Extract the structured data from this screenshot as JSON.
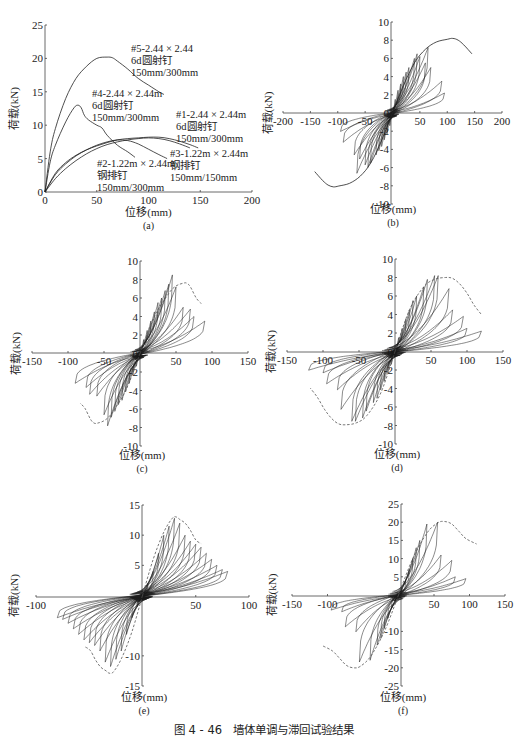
{
  "caption": "图 4 - 46　墙体单调与滞回试验结果",
  "chart_data": [
    {
      "id": "a",
      "type": "line",
      "panel_label": "(a)",
      "xlabel": "位移(mm)",
      "ylabel": "荷载(kN)",
      "xlim": [
        0,
        200
      ],
      "ylim": [
        0,
        25
      ],
      "xticks": [
        0,
        50,
        100,
        150,
        200
      ],
      "yticks": [
        0,
        5,
        10,
        15,
        20,
        25
      ],
      "series": [
        {
          "name": "#5-2.44×2.44 6d圆射钉 150mm/300mm",
          "x": [
            0,
            5,
            10,
            20,
            30,
            40,
            50,
            60,
            65,
            70,
            80,
            90,
            100,
            110,
            115
          ],
          "y": [
            0,
            6,
            9.5,
            14,
            17,
            18.8,
            20,
            20.2,
            20.1,
            19.6,
            18.4,
            17,
            16,
            15,
            14.6
          ]
        },
        {
          "name": "#4-2.44×2.44m 6d圆射钉 150mm/300mm",
          "x": [
            0,
            5,
            10,
            20,
            28,
            32,
            35,
            38,
            42,
            50,
            55,
            60,
            70,
            80,
            87
          ],
          "y": [
            0,
            4.5,
            7,
            10.5,
            12.6,
            13,
            12.6,
            11.5,
            10.8,
            10,
            9.6,
            8.5,
            7,
            6,
            5.2
          ]
        },
        {
          "name": "#1-2.44×2.44m 6d圆射钉 150mm/300mm",
          "x": [
            0,
            10,
            20,
            30,
            40,
            50,
            60,
            70,
            80,
            90,
            100,
            110,
            120,
            130,
            140,
            148
          ],
          "y": [
            0,
            2.8,
            4.4,
            5.5,
            6.3,
            6.9,
            7.4,
            7.8,
            8,
            8.1,
            8.2,
            8.2,
            8,
            7.6,
            7.1,
            6.6
          ]
        },
        {
          "name": "#2-1.22m×2.44m 钢排钉 150mm/300mm",
          "x": [
            0,
            10,
            20,
            30,
            40,
            50,
            60,
            70,
            80,
            90,
            100,
            110,
            118
          ],
          "y": [
            0,
            2.6,
            4.2,
            5.4,
            6.3,
            7,
            7.5,
            7.8,
            7.7,
            7.2,
            6.4,
            5.6,
            5
          ]
        },
        {
          "name": "#3-1.22m×2.44m 钢排钉 150mm/150mm",
          "x": [
            0,
            10,
            20,
            30,
            40,
            50,
            60,
            70,
            80,
            90,
            100,
            110,
            120,
            130,
            140
          ],
          "y": [
            0,
            2,
            3.5,
            4.7,
            5.7,
            6.5,
            7.1,
            7.5,
            7.8,
            8,
            8.1,
            8,
            7.7,
            7.2,
            6.6
          ]
        }
      ],
      "annotations": [
        {
          "lines": [
            "#5-2.44 × 2.44",
            "6d圆射钉",
            "150mm/300mm"
          ]
        },
        {
          "lines": [
            "#4-2.44 × 2.44m",
            "6d圆射钉",
            "150mm/300mm"
          ]
        },
        {
          "lines": [
            "#1-2.44 × 2.44m",
            "6d圆射钉",
            "150mm/300mm"
          ]
        },
        {
          "lines": [
            "#2-1.22m × 2.44m",
            "钢排钉",
            "150mm/300mm"
          ]
        },
        {
          "lines": [
            "#3-1.22m × 2.44m",
            "钢排钉",
            "150mm/150mm"
          ]
        }
      ]
    },
    {
      "id": "b",
      "type": "line",
      "panel_label": "(b)",
      "xlabel": "位移(mm)",
      "ylabel": "荷载(kN)",
      "xlim": [
        -200,
        200
      ],
      "ylim": [
        -10,
        10
      ],
      "xticks": [
        -200,
        -150,
        -100,
        -50,
        50,
        100,
        150,
        200
      ],
      "yticks": [
        -10,
        -8,
        -6,
        -4,
        -2,
        0,
        2,
        4,
        6,
        8,
        10
      ],
      "cycle_amplitudes_mm": [
        5,
        10,
        15,
        20,
        25,
        30,
        40,
        45,
        50,
        60,
        65,
        70,
        90,
        95
      ],
      "cycle_peak_loads_kN": [
        1.5,
        2.5,
        3.2,
        4,
        4.5,
        5,
        6,
        6.5,
        6.2,
        5.5,
        7.2,
        5,
        3.5,
        2.2
      ],
      "envelope": {
        "x": [
          0,
          20,
          40,
          60,
          80,
          100,
          110,
          120,
          130,
          145
        ],
        "y": [
          0,
          3,
          5.5,
          7,
          7.8,
          8.1,
          8.2,
          8,
          7.5,
          6.5
        ]
      },
      "envelope_style": "solid"
    },
    {
      "id": "c",
      "type": "line",
      "panel_label": "(c)",
      "xlabel": "位移(mm)",
      "ylabel": "荷载(kN)",
      "xlim": [
        -150,
        150
      ],
      "ylim": [
        -10,
        10
      ],
      "xticks": [
        -150,
        -100,
        -50,
        50,
        100,
        150
      ],
      "yticks": [
        -10,
        -8,
        -6,
        -4,
        -2,
        0,
        2,
        4,
        6,
        8,
        10
      ],
      "cycle_amplitudes_mm": [
        5,
        10,
        15,
        20,
        25,
        30,
        35,
        40,
        45,
        50,
        60,
        70,
        75,
        90
      ],
      "cycle_peak_loads_kN": [
        1.5,
        2.5,
        3.5,
        4.5,
        5.5,
        6,
        6.8,
        7.5,
        8.5,
        7.2,
        5,
        4.8,
        4,
        3.5
      ],
      "envelope": {
        "x": [
          0,
          20,
          40,
          50,
          60,
          65,
          70,
          78,
          85
        ],
        "y": [
          0,
          4,
          6.5,
          7.3,
          7.6,
          7.6,
          7.2,
          6,
          5.4
        ]
      },
      "envelope_style": "dashed"
    },
    {
      "id": "d",
      "type": "line",
      "panel_label": "(d)",
      "xlabel": "位移(mm)",
      "ylabel": "荷载(kN)",
      "xlim": [
        -150,
        150
      ],
      "ylim": [
        -10,
        10
      ],
      "xticks": [
        -150,
        -100,
        -50,
        50,
        100,
        150
      ],
      "yticks": [
        -10,
        -8,
        -6,
        -4,
        -2,
        0,
        2,
        4,
        6,
        8,
        10
      ],
      "cycle_amplitudes_mm": [
        5,
        10,
        15,
        20,
        25,
        30,
        40,
        45,
        55,
        60,
        75,
        80,
        95,
        100,
        120
      ],
      "cycle_peak_loads_kN": [
        1.5,
        2.5,
        3.5,
        4.5,
        5.5,
        6,
        7,
        7.8,
        8.2,
        8.2,
        6.8,
        4.5,
        3.8,
        2.5,
        2.2
      ],
      "envelope": {
        "x": [
          0,
          20,
          40,
          55,
          70,
          80,
          90,
          100,
          110,
          120
        ],
        "y": [
          0,
          4.5,
          7,
          7.8,
          8,
          7.9,
          7.3,
          6.3,
          5,
          4
        ]
      },
      "envelope_style": "dashed"
    },
    {
      "id": "e",
      "type": "line",
      "panel_label": "(e)",
      "xlabel": "位移(mm)",
      "ylabel": "荷载(kN)",
      "xlim": [
        -100,
        100
      ],
      "ylim": [
        -15,
        15
      ],
      "xticks": [
        -100,
        50,
        100
      ],
      "yticks": [
        -15,
        -10,
        5,
        10,
        15
      ],
      "cycle_amplitudes_mm": [
        5,
        10,
        15,
        20,
        25,
        30,
        35,
        40,
        45,
        50,
        55,
        60,
        65,
        70,
        75,
        80
      ],
      "cycle_peak_loads_kN": [
        2,
        4,
        7,
        10,
        11.5,
        12.8,
        12,
        10,
        9,
        8.5,
        8,
        7,
        6,
        5,
        4.3,
        4
      ],
      "envelope": {
        "x": [
          0,
          10,
          20,
          28,
          32,
          35,
          40,
          45,
          50,
          55
        ],
        "y": [
          0,
          6,
          10.5,
          12.8,
          13,
          12.6,
          12,
          10.8,
          9.2,
          8.6
        ]
      },
      "envelope_style": "dashed"
    },
    {
      "id": "f",
      "type": "line",
      "panel_label": "(f)",
      "xlabel": "位移(mm)",
      "ylabel": "荷载(kN)",
      "xlim": [
        -150,
        150
      ],
      "ylim": [
        -25,
        25
      ],
      "xticks": [
        -150,
        -100,
        50,
        100,
        150
      ],
      "yticks": [
        -25,
        -20,
        -15,
        -10,
        5,
        10,
        15,
        20,
        25
      ],
      "cycle_amplitudes_mm": [
        5,
        10,
        15,
        20,
        25,
        30,
        40,
        55,
        60,
        75,
        80,
        95
      ],
      "cycle_peak_loads_kN": [
        2,
        4,
        7,
        10,
        13,
        15,
        19.5,
        20,
        11,
        9.5,
        5,
        4.5
      ],
      "envelope": {
        "x": [
          0,
          20,
          40,
          55,
          65,
          75,
          85,
          95,
          110
        ],
        "y": [
          0,
          10,
          17,
          19.8,
          20.2,
          19.5,
          17.5,
          15.5,
          14
        ]
      },
      "envelope_style": "dashed"
    }
  ]
}
